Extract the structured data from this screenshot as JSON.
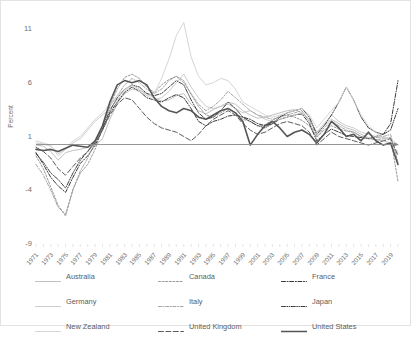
{
  "axis": {
    "y_title": "Percent",
    "y_ticks": [
      "11",
      "6",
      "1",
      "-4",
      "-9"
    ],
    "x_ticks": [
      "1971",
      "1973",
      "1975",
      "1977",
      "1979",
      "1981",
      "1983",
      "1985",
      "1987",
      "1989",
      "1991",
      "1993",
      "1995",
      "1997",
      "1999",
      "2001",
      "2003",
      "2005",
      "2007",
      "2009",
      "2011",
      "2013",
      "2015",
      "2017",
      "2019"
    ]
  },
  "legend": {
    "items": [
      {
        "label": "Australia",
        "key": "australia-line-key",
        "color": "#b9b9b9",
        "dash": "none",
        "width": 0.9
      },
      {
        "label": "Canada",
        "key": "canada-line-key",
        "color": "#8d8d8d",
        "dash": "2,1.6",
        "width": 0.9
      },
      {
        "label": "France",
        "key": "france-line-key",
        "color": "#3a3a3a",
        "dash": "4,1.6,1,1.6",
        "width": 1.0
      },
      {
        "label": "Germany",
        "key": "germany-line-key",
        "color": "#c6c6c6",
        "dash": "none",
        "width": 0.9
      },
      {
        "label": "Italy",
        "key": "italy-line-key",
        "color": "#9a9a9a",
        "dash": "3,1.6,1,1.6",
        "width": 0.9
      },
      {
        "label": "Japan",
        "key": "japan-line-key",
        "color": "#404040",
        "dash": "4,1.4,.8,1.4,.8,1.4",
        "width": 1.0
      },
      {
        "label": "New Zealand",
        "key": "new-zealand-line-key",
        "color": "#d0d0d0",
        "dash": "none",
        "width": 0.9
      },
      {
        "label": "United Kingdom",
        "key": "united-kingdom-line-key",
        "color": "#5c5c5c",
        "dash": "5,2.4",
        "width": 1.0
      },
      {
        "label": "United States",
        "key": "united-states-line-key",
        "color": "#555555",
        "dash": "none",
        "width": 1.6
      }
    ]
  },
  "chart_data": {
    "type": "line",
    "title": "",
    "xlabel": "",
    "ylabel": "Percent",
    "ylim": [
      -9,
      11
    ],
    "xlim": [
      1971,
      2020
    ],
    "grid": false,
    "legend_position": "bottom",
    "zero_line": true,
    "x": [
      1971,
      1972,
      1973,
      1974,
      1975,
      1976,
      1977,
      1978,
      1979,
      1980,
      1981,
      1982,
      1983,
      1984,
      1985,
      1986,
      1987,
      1988,
      1989,
      1990,
      1991,
      1992,
      1993,
      1994,
      1995,
      1996,
      1997,
      1998,
      1999,
      2000,
      2001,
      2002,
      2003,
      2004,
      2005,
      2006,
      2007,
      2008,
      2009,
      2010,
      2011,
      2012,
      2013,
      2014,
      2015,
      2016,
      2017,
      2018,
      2019,
      2020
    ],
    "series": [
      {
        "name": "Australia",
        "color": "#b9b9b9",
        "dash": "none",
        "values": [
          0.2,
          0.1,
          -0.4,
          -1.2,
          -0.5,
          -0.3,
          -0.2,
          0.0,
          0.1,
          0.8,
          2.6,
          4.1,
          5.0,
          5.4,
          5.3,
          5.0,
          4.6,
          4.3,
          4.4,
          4.8,
          5.0,
          4.0,
          3.4,
          3.1,
          3.5,
          3.8,
          4.2,
          4.0,
          3.4,
          3.0,
          2.7,
          2.8,
          3.0,
          3.2,
          3.4,
          3.5,
          3.2,
          2.6,
          1.4,
          2.0,
          2.6,
          2.2,
          1.8,
          1.6,
          1.2,
          0.9,
          0.7,
          0.6,
          0.4,
          -0.6
        ]
      },
      {
        "name": "Canada",
        "color": "#8d8d8d",
        "dash": "2,1.6",
        "values": [
          -0.8,
          -2.0,
          -3.7,
          -5.4,
          -6.4,
          -3.9,
          -2.4,
          -1.6,
          -0.2,
          1.8,
          3.9,
          5.4,
          6.5,
          6.8,
          6.4,
          5.6,
          5.1,
          5.8,
          6.3,
          6.6,
          6.2,
          4.9,
          3.8,
          3.0,
          2.8,
          3.2,
          3.6,
          3.2,
          2.6,
          2.4,
          2.0,
          2.1,
          2.5,
          2.9,
          3.0,
          2.8,
          2.5,
          2.0,
          0.9,
          1.6,
          2.0,
          1.7,
          1.5,
          1.4,
          1.0,
          0.8,
          0.7,
          0.8,
          0.9,
          -3.2
        ]
      },
      {
        "name": "France",
        "color": "#3a3a3a",
        "dash": "4,1.6,1,1.6",
        "values": [
          -0.5,
          -1.6,
          -2.8,
          -3.6,
          -4.2,
          -2.8,
          -1.5,
          -0.8,
          0.2,
          1.6,
          3.2,
          4.2,
          5.1,
          5.6,
          5.2,
          4.6,
          4.4,
          4.2,
          4.6,
          4.9,
          4.6,
          3.6,
          2.4,
          2.0,
          2.4,
          2.6,
          2.9,
          3.0,
          2.8,
          2.6,
          2.2,
          2.0,
          2.2,
          2.6,
          2.8,
          3.0,
          3.1,
          2.2,
          0.6,
          1.2,
          1.7,
          1.4,
          1.1,
          1.0,
          0.9,
          0.8,
          1.0,
          1.2,
          2.2,
          6.2
        ]
      },
      {
        "name": "Germany",
        "color": "#c6c6c6",
        "dash": "none",
        "values": [
          0.4,
          0.3,
          0.1,
          -0.6,
          -0.2,
          0.4,
          0.8,
          1.6,
          2.4,
          3.0,
          3.6,
          4.4,
          5.2,
          5.8,
          5.4,
          4.8,
          4.4,
          4.6,
          5.2,
          6.0,
          6.8,
          5.6,
          4.6,
          3.8,
          3.6,
          3.8,
          4.0,
          3.6,
          3.2,
          3.4,
          3.0,
          2.6,
          2.4,
          2.6,
          2.8,
          3.0,
          3.2,
          2.6,
          1.4,
          2.2,
          3.0,
          2.4,
          2.0,
          1.8,
          1.4,
          1.2,
          1.0,
          0.9,
          0.8,
          0.2
        ]
      },
      {
        "name": "Italy",
        "color": "#9a9a9a",
        "dash": "3,1.6,1,1.6",
        "values": [
          -1.6,
          -2.6,
          -4.0,
          -5.6,
          -6.2,
          -4.0,
          -2.2,
          -1.0,
          0.4,
          2.0,
          3.8,
          4.8,
          5.8,
          6.4,
          6.0,
          5.4,
          5.0,
          5.4,
          6.2,
          6.6,
          6.0,
          5.0,
          4.0,
          3.4,
          3.8,
          4.4,
          5.2,
          4.6,
          4.0,
          3.4,
          3.0,
          2.8,
          2.6,
          2.8,
          3.0,
          3.2,
          3.4,
          2.4,
          1.0,
          1.8,
          2.4,
          2.0,
          1.6,
          1.4,
          1.0,
          0.8,
          0.9,
          1.0,
          1.2,
          -1.4
        ]
      },
      {
        "name": "Japan",
        "color": "#404040",
        "dash": "4,1.4,.8,1.4,.8,1.4",
        "values": [
          -0.6,
          -1.4,
          -2.4,
          -3.0,
          -3.8,
          -2.4,
          -1.2,
          -0.4,
          0.6,
          1.8,
          3.4,
          4.6,
          5.4,
          5.8,
          5.6,
          5.0,
          4.8,
          5.0,
          5.6,
          6.2,
          5.8,
          4.4,
          3.2,
          2.6,
          2.8,
          3.4,
          4.2,
          3.6,
          2.8,
          2.4,
          2.0,
          1.8,
          2.2,
          2.8,
          3.2,
          3.4,
          3.6,
          2.8,
          1.2,
          2.0,
          3.0,
          4.2,
          5.6,
          4.4,
          2.8,
          1.8,
          1.4,
          1.2,
          1.6,
          3.6
        ]
      },
      {
        "name": "New Zealand",
        "color": "#d0d0d0",
        "dash": "none",
        "values": [
          0.6,
          0.4,
          0.2,
          -0.8,
          -0.2,
          0.6,
          1.0,
          1.8,
          2.6,
          3.2,
          4.0,
          4.8,
          5.4,
          5.8,
          5.2,
          4.8,
          5.0,
          6.4,
          8.2,
          10.4,
          11.6,
          8.4,
          6.6,
          5.8,
          6.0,
          6.4,
          6.2,
          5.4,
          4.2,
          3.8,
          3.4,
          3.0,
          2.8,
          3.0,
          3.2,
          3.4,
          3.6,
          3.0,
          1.8,
          2.6,
          3.4,
          4.2,
          5.6,
          4.4,
          3.0,
          2.0,
          1.4,
          0.8,
          0.2,
          -0.4
        ]
      },
      {
        "name": "United Kingdom",
        "color": "#5c5c5c",
        "dash": "5,2.4",
        "values": [
          0.0,
          -0.4,
          -1.0,
          -2.0,
          -2.6,
          -1.8,
          -1.0,
          -0.4,
          0.4,
          1.6,
          3.0,
          4.0,
          4.6,
          4.4,
          3.6,
          2.8,
          2.2,
          1.8,
          1.6,
          1.4,
          1.0,
          0.6,
          1.2,
          2.0,
          2.6,
          3.0,
          3.4,
          3.0,
          2.2,
          1.6,
          1.2,
          1.4,
          1.8,
          2.2,
          2.4,
          2.2,
          2.0,
          1.4,
          0.2,
          0.8,
          1.4,
          1.0,
          0.8,
          0.6,
          0.4,
          0.2,
          0.4,
          0.6,
          0.8,
          -0.8
        ]
      },
      {
        "name": "United States",
        "color": "#555555",
        "dash": "none",
        "values": [
          -0.2,
          -0.3,
          -0.2,
          -0.4,
          -0.1,
          0.2,
          0.1,
          0.0,
          0.6,
          2.0,
          4.2,
          5.8,
          6.2,
          6.0,
          6.2,
          5.8,
          4.6,
          3.8,
          3.4,
          3.2,
          3.6,
          3.4,
          2.8,
          2.6,
          3.0,
          3.4,
          3.6,
          3.2,
          2.4,
          0.2,
          1.2,
          2.0,
          2.4,
          1.8,
          1.0,
          1.4,
          1.6,
          1.2,
          0.4,
          1.2,
          2.4,
          1.8,
          1.0,
          1.2,
          0.6,
          1.4,
          0.6,
          0.2,
          0.4,
          -1.6
        ]
      }
    ]
  }
}
